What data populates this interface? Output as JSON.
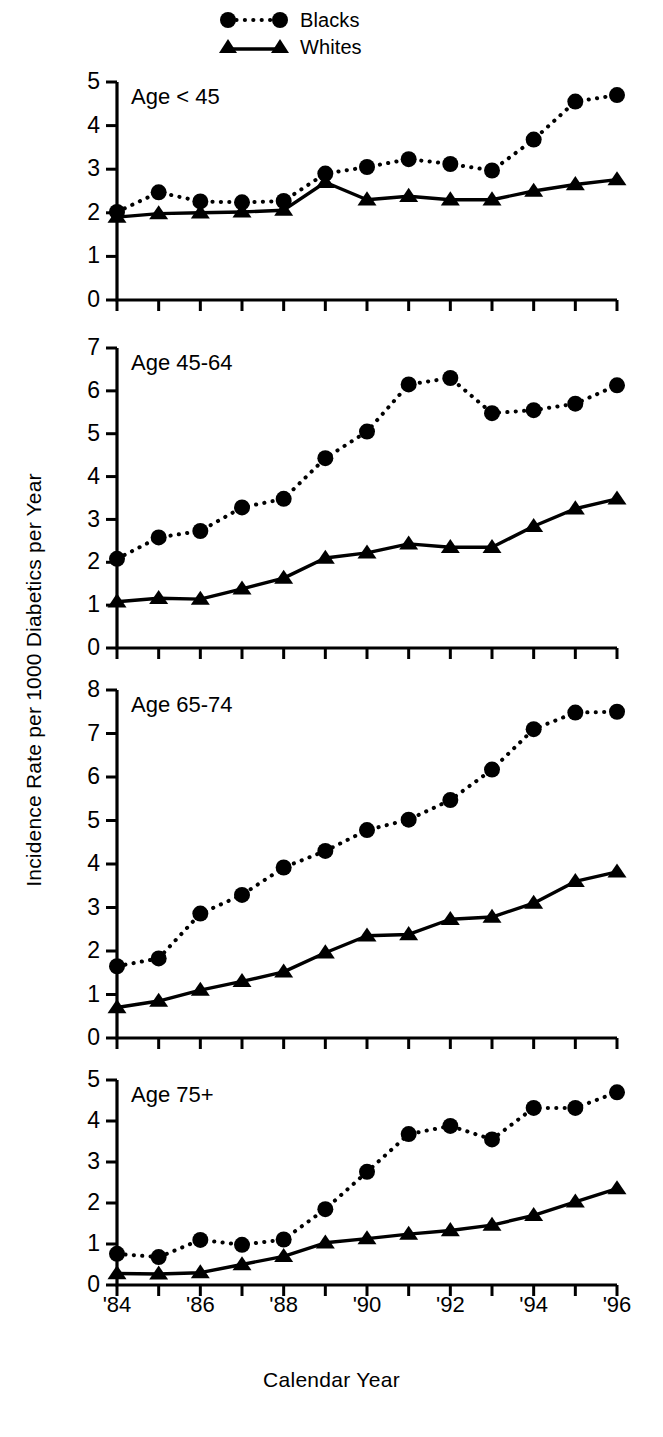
{
  "legend": {
    "position": "top-center",
    "entries": [
      {
        "label": "Blacks",
        "marker": "circle",
        "line": "dotted"
      },
      {
        "label": "Whites",
        "marker": "triangle",
        "line": "solid"
      }
    ]
  },
  "axis_titles": {
    "y": "Incidence Rate per 1000 Diabetics per Year",
    "x": "Calendar Year"
  },
  "x_tick_labels": [
    "'84",
    "",
    "'86",
    "",
    "'88",
    "",
    "'90",
    "",
    "'92",
    "",
    "'94",
    "",
    "'96"
  ],
  "chart_data": [
    {
      "type": "line",
      "title": "Age < 45",
      "xlabel": "Calendar Year",
      "ylabel": "Incidence Rate per 1000 Diabetics per Year",
      "x": [
        1984,
        1985,
        1986,
        1987,
        1988,
        1989,
        1990,
        1991,
        1992,
        1993,
        1994,
        1995,
        1996
      ],
      "xtick_labels": [
        "'84",
        "",
        "'86",
        "",
        "'88",
        "",
        "'90",
        "",
        "'92",
        "",
        "'94",
        "",
        "'96"
      ],
      "ylim": [
        0,
        5
      ],
      "yticks": [
        0,
        1,
        2,
        3,
        4,
        5
      ],
      "grid": false,
      "legend": "top-center",
      "series": [
        {
          "name": "Blacks",
          "marker": "circle",
          "line": "dotted",
          "values": [
            2.02,
            2.47,
            2.26,
            2.24,
            2.27,
            2.9,
            3.05,
            3.23,
            3.12,
            2.97,
            3.68,
            4.55,
            4.7
          ]
        },
        {
          "name": "Whites",
          "marker": "triangle",
          "line": "solid",
          "values": [
            1.9,
            1.98,
            2.0,
            2.02,
            2.06,
            2.7,
            2.3,
            2.38,
            2.3,
            2.3,
            2.5,
            2.65,
            2.76
          ]
        }
      ]
    },
    {
      "type": "line",
      "title": "Age 45-64",
      "xlabel": "Calendar Year",
      "ylabel": "Incidence Rate per 1000 Diabetics per Year",
      "x": [
        1984,
        1985,
        1986,
        1987,
        1988,
        1989,
        1990,
        1991,
        1992,
        1993,
        1994,
        1995,
        1996
      ],
      "xtick_labels": [
        "'84",
        "",
        "'86",
        "",
        "'88",
        "",
        "'90",
        "",
        "'92",
        "",
        "'94",
        "",
        "'96"
      ],
      "ylim": [
        0,
        7
      ],
      "yticks": [
        0,
        1,
        2,
        3,
        4,
        5,
        6,
        7
      ],
      "grid": false,
      "legend": "top-center",
      "series": [
        {
          "name": "Blacks",
          "marker": "circle",
          "line": "dotted",
          "values": [
            2.08,
            2.58,
            2.73,
            3.28,
            3.48,
            4.43,
            5.05,
            6.15,
            6.3,
            5.48,
            5.55,
            5.7,
            6.13
          ]
        },
        {
          "name": "Whites",
          "marker": "triangle",
          "line": "solid",
          "values": [
            1.08,
            1.16,
            1.14,
            1.38,
            1.63,
            2.1,
            2.22,
            2.43,
            2.35,
            2.35,
            2.84,
            3.25,
            3.48
          ]
        }
      ]
    },
    {
      "type": "line",
      "title": "Age 65-74",
      "xlabel": "Calendar Year",
      "ylabel": "Incidence Rate per 1000 Diabetics per Year",
      "x": [
        1984,
        1985,
        1986,
        1987,
        1988,
        1989,
        1990,
        1991,
        1992,
        1993,
        1994,
        1995,
        1996
      ],
      "xtick_labels": [
        "'84",
        "",
        "'86",
        "",
        "'88",
        "",
        "'90",
        "",
        "'92",
        "",
        "'94",
        "",
        "'96"
      ],
      "ylim": [
        0,
        8
      ],
      "yticks": [
        0,
        1,
        2,
        3,
        4,
        5,
        6,
        7,
        8
      ],
      "grid": false,
      "legend": "top-center",
      "series": [
        {
          "name": "Blacks",
          "marker": "circle",
          "line": "dotted",
          "values": [
            1.65,
            1.83,
            2.86,
            3.29,
            3.92,
            4.3,
            4.78,
            5.02,
            5.47,
            6.17,
            7.1,
            7.48,
            7.5
          ]
        },
        {
          "name": "Whites",
          "marker": "triangle",
          "line": "solid",
          "values": [
            0.7,
            0.85,
            1.1,
            1.3,
            1.52,
            1.96,
            2.35,
            2.38,
            2.73,
            2.78,
            3.1,
            3.6,
            3.82
          ]
        }
      ]
    },
    {
      "type": "line",
      "title": "Age 75+",
      "xlabel": "Calendar Year",
      "ylabel": "Incidence Rate per 1000 Diabetics per Year",
      "x": [
        1984,
        1985,
        1986,
        1987,
        1988,
        1989,
        1990,
        1991,
        1992,
        1993,
        1994,
        1995,
        1996
      ],
      "xtick_labels": [
        "'84",
        "",
        "'86",
        "",
        "'88",
        "",
        "'90",
        "",
        "'92",
        "",
        "'94",
        "",
        "'96"
      ],
      "ylim": [
        0,
        5
      ],
      "yticks": [
        0,
        1,
        2,
        3,
        4,
        5
      ],
      "grid": false,
      "legend": "top-center",
      "series": [
        {
          "name": "Blacks",
          "marker": "circle",
          "line": "dotted",
          "values": [
            0.76,
            0.68,
            1.1,
            0.98,
            1.11,
            1.85,
            2.76,
            3.68,
            3.88,
            3.55,
            4.32,
            4.32,
            4.7
          ]
        },
        {
          "name": "Whites",
          "marker": "triangle",
          "line": "solid",
          "values": [
            0.28,
            0.27,
            0.3,
            0.5,
            0.7,
            1.03,
            1.13,
            1.24,
            1.33,
            1.46,
            1.7,
            2.03,
            2.35
          ]
        }
      ]
    }
  ]
}
